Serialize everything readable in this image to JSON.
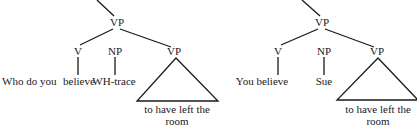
{
  "diagram": {
    "type": "syntax-trees",
    "trees": [
      {
        "id": "left",
        "root": "VP",
        "children": [
          {
            "label": "V",
            "leaf": "believe"
          },
          {
            "label": "NP",
            "leaf": "WH-trace"
          },
          {
            "label": "VP",
            "triangle": true,
            "leaf_line1": "to have left the",
            "leaf_line2": "room"
          }
        ],
        "prefix": "Who do you"
      },
      {
        "id": "right",
        "root": "VP",
        "children": [
          {
            "label": "V",
            "leaf": "You believe"
          },
          {
            "label": "NP",
            "leaf": "Sue"
          },
          {
            "label": "VP",
            "triangle": true,
            "leaf_line1": "to have left the",
            "leaf_line2": "room"
          }
        ]
      }
    ]
  }
}
